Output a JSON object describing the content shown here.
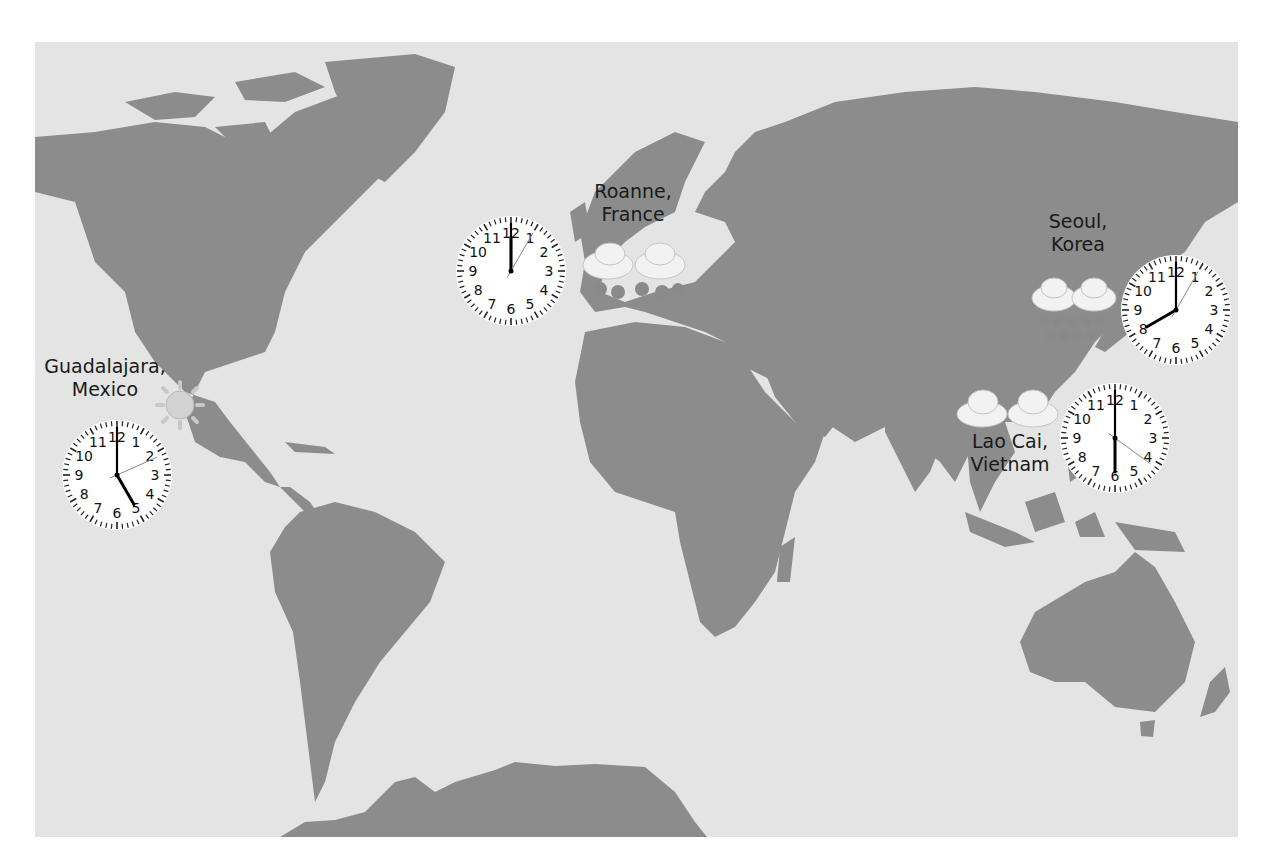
{
  "title_fragment": "World",
  "map": {
    "background": "#e4e4e4",
    "land": "#8c8c8c"
  },
  "locations": [
    {
      "name": "Guadalajara,",
      "region": "Mexico",
      "weather": "sunny",
      "clock": {
        "hour": 5,
        "minute": 0,
        "second": 11
      }
    },
    {
      "name": "Roanne,",
      "region": "France",
      "weather": "rain",
      "clock": {
        "hour": 12,
        "minute": 0,
        "second": 5
      }
    },
    {
      "name": "Seoul,",
      "region": "Korea",
      "weather": "rain",
      "clock": {
        "hour": 8,
        "minute": 0,
        "second": 5
      }
    },
    {
      "name": "Lao Cai,",
      "region": "Vietnam",
      "weather": "cloudy",
      "clock": {
        "hour": 6,
        "minute": 0,
        "second": 21
      }
    }
  ],
  "clock_numbers": [
    "12",
    "1",
    "2",
    "3",
    "4",
    "5",
    "6",
    "7",
    "8",
    "9",
    "10",
    "11"
  ]
}
